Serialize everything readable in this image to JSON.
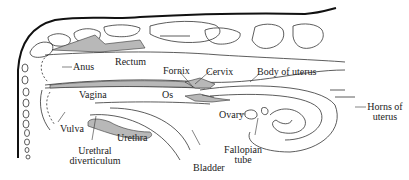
{
  "diagram": {
    "colors": {
      "tissue_fill": "#b8b8b8",
      "outline": "#333333",
      "spine_fill": "#ffffff",
      "skin": "#111111"
    },
    "labels": {
      "anus": "Anus",
      "rectum": "Rectum",
      "fornix": "Fornix",
      "cervix": "Cervix",
      "body_of_uterus": "Body of uterus",
      "vagina": "Vagina",
      "os": "Os",
      "ovary": "Ovary",
      "horns_of_uterus_1": "Horns of",
      "horns_of_uterus_2": "uterus",
      "vulva": "Vulva",
      "urethra": "Urethra",
      "urethral_diverticulum_1": "Urethral",
      "urethral_diverticulum_2": "diverticulum",
      "fallopian_tube_1": "Fallopian",
      "fallopian_tube_2": "tube",
      "bladder": "Bladder"
    }
  }
}
